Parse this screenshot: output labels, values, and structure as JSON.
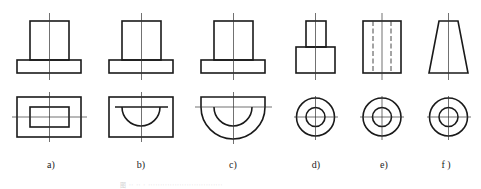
{
  "figure": {
    "type": "orthographic-views",
    "views_per_figure": [
      "front-view",
      "top-view"
    ],
    "colors": {
      "line": "#1a1a1a",
      "centerline": "#333333",
      "background": "#ffffff"
    },
    "subfigures": [
      {
        "id": "a",
        "label": "a)",
        "front_view": "stepped block (narrow top on wide base)",
        "top_view": "rectangle with inner rectangle"
      },
      {
        "id": "b",
        "label": "b)",
        "front_view": "stepped block (narrow top on wide base)",
        "top_view": "rectangle with inner half-circle"
      },
      {
        "id": "c",
        "label": "c)",
        "front_view": "stepped block (narrow top on wide base)",
        "top_view": "half-round base with inner half-circle"
      },
      {
        "id": "d",
        "label": "d)",
        "front_view": "stepped cylinder (small on large)",
        "top_view": "two concentric circles"
      },
      {
        "id": "e",
        "label": "e)",
        "front_view": "rectangle with hidden bore lines",
        "top_view": "two concentric circles"
      },
      {
        "id": "f",
        "label": "f )",
        "front_view": "trapezoid (frustum)",
        "top_view": "two concentric circles"
      }
    ],
    "caption": "图 ·· ·· · ·······························"
  }
}
